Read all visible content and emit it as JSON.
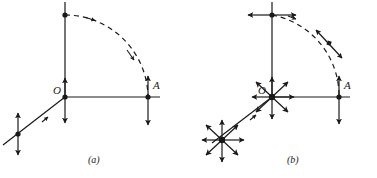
{
  "figure": {
    "type": "diagram",
    "background_color": "#ffffff",
    "ink_color": "#1a1a1a",
    "panels": [
      {
        "id": "a",
        "caption": "(a)",
        "caption_x": 94,
        "caption_y": 161,
        "origin_label": "O",
        "origin_label_x": 53,
        "origin_label_y": 89,
        "point_label": "A",
        "point_label_x": 153,
        "point_label_y": 84,
        "origin": [
          65,
          97
        ],
        "point_a": [
          148,
          97
        ],
        "top_point": [
          65,
          15
        ],
        "z_point": [
          18,
          134
        ],
        "vectors_at_origin": [
          "up",
          "down"
        ],
        "vectors_at_point_a": [
          "up",
          "down"
        ],
        "vectors_at_top_point": [],
        "vectors_at_z_point": [
          "up",
          "down"
        ],
        "arc_direction": "clockwise",
        "arc_arrowheads": 2
      },
      {
        "id": "b",
        "caption": "(b)",
        "caption_x": 292,
        "caption_y": 161,
        "origin_label": "O",
        "origin_label_x": 259,
        "origin_label_y": 89,
        "point_label": "A",
        "point_label_x": 344,
        "point_label_y": 84,
        "origin": [
          272,
          97
        ],
        "point_a": [
          339,
          97
        ],
        "top_point": [
          272,
          15
        ],
        "z_point": [
          222,
          140
        ],
        "vectors_at_origin": [
          "starburst-8"
        ],
        "vectors_at_point_a": [
          "up",
          "down"
        ],
        "vectors_at_top_point": [
          "left",
          "right"
        ],
        "vectors_at_z_point": [
          "starburst-8"
        ],
        "arc_direction": "counterclockwise",
        "arc_arrowheads": 3,
        "arc_midpoint_dot": true
      }
    ],
    "axes": {
      "vertical_label": "y",
      "horizontal_label": "x",
      "depth_label": "z",
      "line_width": 1.2,
      "arc_dash": "5 4"
    }
  }
}
